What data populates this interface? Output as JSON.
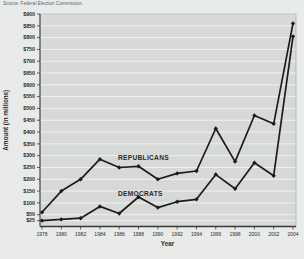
{
  "source_note": "Source: Federal Election Commission.",
  "chart_data": {
    "type": "line",
    "title": "",
    "xlabel": "Year",
    "ylabel": "Amount (in millions)",
    "x": [
      1978,
      1980,
      1982,
      1984,
      1986,
      1988,
      1990,
      1992,
      1994,
      1996,
      1998,
      2000,
      2002,
      2004
    ],
    "series": [
      {
        "name": "REPUBLICANS",
        "values": [
          60,
          150,
          200,
          285,
          250,
          255,
          200,
          225,
          235,
          415,
          275,
          470,
          435,
          860
        ]
      },
      {
        "name": "DEMOCRATS",
        "values": [
          25,
          30,
          35,
          85,
          55,
          125,
          80,
          105,
          115,
          220,
          160,
          270,
          215,
          805
        ]
      }
    ],
    "y_ticks": [
      25,
      50,
      100,
      150,
      200,
      250,
      300,
      350,
      400,
      450,
      500,
      550,
      600,
      650,
      700,
      750,
      800,
      850,
      900
    ],
    "y_tick_prefix": "$",
    "ylim": [
      0,
      900
    ],
    "grid": "horizontal",
    "legend_position": "inline-labels",
    "colors": {
      "line": "#1c1c1c",
      "plot_bg": "#d6d9d7",
      "gridline": "#f3f5f4",
      "page_bg": "#e8ebea",
      "axis": "#3a3a3a",
      "text": "#2b2b2b"
    }
  }
}
